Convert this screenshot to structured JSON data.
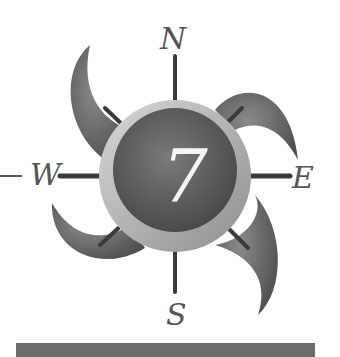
{
  "logo": {
    "number": "7",
    "directions": {
      "north": "N",
      "east": "E",
      "south": "S",
      "west": "W"
    }
  },
  "colors": {
    "dark_gray": "#5e5e5e",
    "mid_gray": "#7a7a7a",
    "ring_light": "#bdbdbd",
    "bar": "#6b6b6b",
    "label": "#555555",
    "number": "#f4f4f4"
  }
}
